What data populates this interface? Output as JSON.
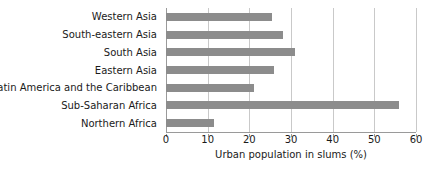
{
  "chart_data": {
    "type": "bar",
    "orientation": "horizontal",
    "title": "",
    "xlabel": "Urban population in slums (%)",
    "ylabel": "",
    "categories": [
      "Western Asia",
      "South-eastern Asia",
      "South Asia",
      "Eastern Asia",
      "Latin America and the Caribbean",
      "Sub-Saharan Africa",
      "Northern Africa"
    ],
    "values": [
      25.5,
      28,
      31,
      26,
      21,
      56,
      11.5
    ],
    "xlim": [
      0,
      60
    ],
    "xticks": [
      0,
      10,
      20,
      30,
      40,
      50,
      60
    ],
    "xtick_labels": [
      "0",
      "10",
      "20",
      "30",
      "40",
      "50",
      "60"
    ],
    "grid": "vertical",
    "legend": "none",
    "bar_color": "#8c8c8c",
    "grid_color": "#c9c9c9",
    "axis_color": "#9a9a9a",
    "background_color": "#ffffff"
  }
}
